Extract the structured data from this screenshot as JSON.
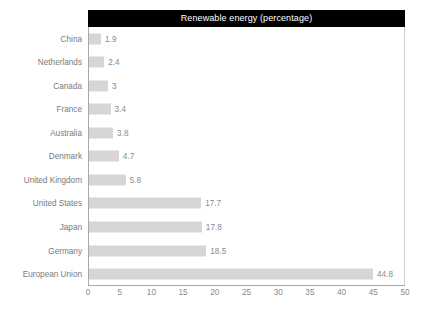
{
  "chart_data": {
    "type": "bar",
    "orientation": "horizontal",
    "title": "Renewable energy (percentage)",
    "xlabel": "",
    "ylabel": "",
    "xlim": [
      0,
      50
    ],
    "xticks": [
      0,
      5,
      10,
      15,
      20,
      25,
      30,
      35,
      40,
      45,
      50
    ],
    "grid": false,
    "legend": false,
    "show_value_labels": true,
    "categories": [
      "China",
      "Netherlands",
      "Canada",
      "France",
      "Australia",
      "Denmark",
      "United Kingdom",
      "United States",
      "Japan",
      "Germany",
      "European Union"
    ],
    "values": [
      1.9,
      2.4,
      3,
      3.4,
      3.8,
      4.7,
      5.8,
      17.7,
      17.8,
      18.5,
      44.8
    ],
    "value_labels": [
      "1.9",
      "2.4",
      "3",
      "3.4",
      "3.8",
      "4.7",
      "5.8",
      "17.7",
      "17.8",
      "18.5",
      "44.8"
    ],
    "colors": {
      "bar": "#d6d6d6",
      "title_background": "#000000",
      "title_text": "#ffffff",
      "axis_line": "#a8a8a8",
      "label_text": "#7a7a7a",
      "value_text": "#8a8a8a",
      "plot_background": "#ffffff"
    }
  }
}
